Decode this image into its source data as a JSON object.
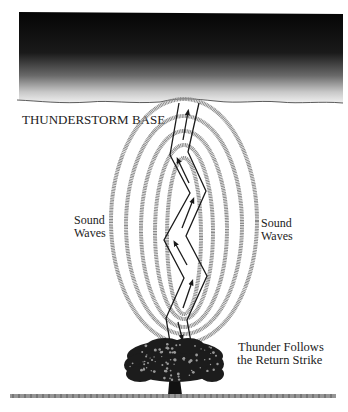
{
  "diagram": {
    "labels": {
      "cloud_base": "THUNDERSTORM BASE",
      "left_waves_line1": "Sound",
      "left_waves_line2": "Waves",
      "right_waves_line1": "Sound",
      "right_waves_line2": "Waves",
      "thunder_line1": "Thunder Follows",
      "thunder_line2": "the Return Strike"
    },
    "elements": {
      "cloud": "thunderstorm-cloud",
      "lightning": "lightning-channel",
      "sound_wave_rings": 5,
      "tree": "tree",
      "ground": "ground-line"
    },
    "colors": {
      "cloud_dark": "#0a0a0a",
      "ring": "#8a8a8a",
      "bolt": "#1a1a1a",
      "tree": "#1c1c1c",
      "ground": "#7a7a7a"
    }
  }
}
